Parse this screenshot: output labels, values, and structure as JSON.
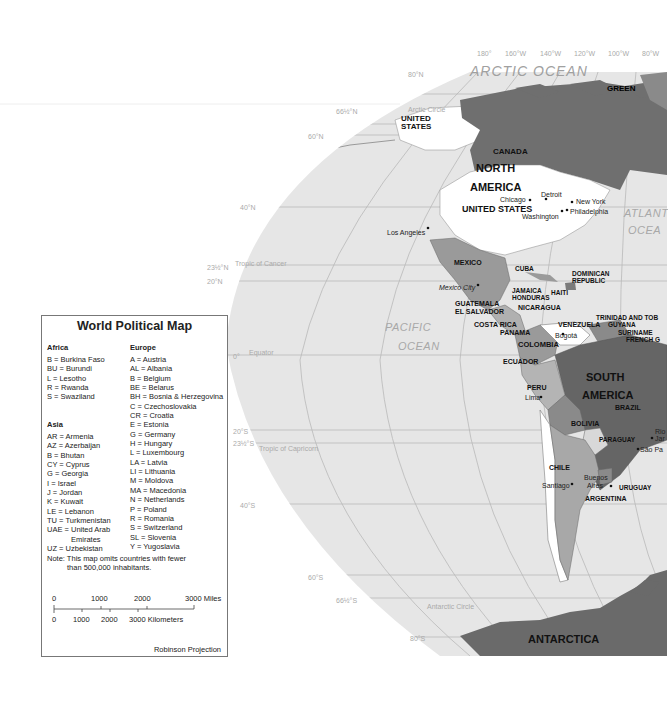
{
  "map": {
    "title": "World Political Map",
    "projection": "Robinson Projection",
    "colors": {
      "ocean": "#e6e6e6",
      "land_dark": "#6b6b6b",
      "land_medium": "#909090",
      "land_light": "#b4b4b4",
      "land_white": "#ffffff",
      "gridline": "#b8b8b8",
      "legend_border": "#777777"
    },
    "longitude_labels": [
      "180°",
      "160°W",
      "140°W",
      "120°W",
      "100°W",
      "80°W"
    ],
    "latitude_labels": {
      "n80": "80°N",
      "n66": "66½°N",
      "n60": "60°N",
      "n40": "40°N",
      "n23": "23½°N",
      "n20": "20°N",
      "eq": "0°",
      "s20": "20°S",
      "s23": "23½°S",
      "s40": "40°S",
      "s60": "60°S",
      "s66": "66½°S",
      "s80": "80°S"
    },
    "special_lines": {
      "arctic_circle": "Arctic Circle",
      "tropic_cancer": "Tropic of Cancer",
      "equator": "Equator",
      "tropic_capricorn": "Tropic of Capricorn",
      "antarctic_circle": "Antarctic Circle"
    },
    "oceans": {
      "arctic": "ARCTIC OCEAN",
      "pacific_1": "PACIFIC",
      "pacific_2": "OCEAN",
      "atlantic_1": "ATLANT",
      "atlantic_2": "OCEA"
    },
    "continents": {
      "north_1": "NORTH",
      "north_2": "AMERICA",
      "south_1": "SOUTH",
      "south_2": "AMERICA",
      "antarctica": "ANTARCTICA"
    },
    "countries": {
      "us_alaska_1": "UNITED",
      "us_alaska_2": "STATES",
      "canada": "CANADA",
      "united_states": "UNITED STATES",
      "greenland": "GREEN",
      "mexico": "MEXICO",
      "cuba": "CUBA",
      "dominican_1": "DOMINICAN",
      "dominican_2": "REPUBLIC",
      "jamaica": "JAMAICA",
      "haiti": "HAITI",
      "honduras": "HONDURAS",
      "guatemala": "GUATEMALA",
      "el_salvador": "EL SALVADOR",
      "nicaragua": "NICARAGUA",
      "costa_rica": "COSTA RICA",
      "panama": "PANAMA",
      "trinidad": "TRINIDAD AND TOB",
      "venezuela": "VENEZUELA",
      "guyana": "GUYANA",
      "suriname": "SURINAME",
      "french_guiana": "FRENCH G",
      "colombia": "COLOMBIA",
      "ecuador": "ECUADOR",
      "peru": "PERU",
      "brazil": "BRAZIL",
      "bolivia": "BOLIVIA",
      "paraguay": "PARAGUAY",
      "chile": "CHILE",
      "uruguay": "URUGUAY",
      "argentina": "ARGENTINA"
    },
    "cities": {
      "chicago": "Chicago",
      "detroit": "Detroit",
      "new_york": "New York",
      "philadelphia": "Philadelphia",
      "washington": "Washington",
      "los_angeles": "Los Angeles",
      "mexico_city": "Mexico City",
      "bogota": "Bogotá",
      "lima": "Lima",
      "rio_1": "Rio",
      "rio_2": "Jar",
      "sao_paulo": "São Pa",
      "santiago": "Santiago",
      "buenos_1": "Buenos",
      "buenos_2": "Aires"
    }
  },
  "legend": {
    "title": "World Political Map",
    "africa": {
      "heading": "Africa",
      "items": [
        "B = Burkina Faso",
        "BU = Burundi",
        "L = Lesotho",
        "R = Rwanda",
        "S = Swaziland"
      ]
    },
    "asia": {
      "heading": "Asia",
      "items": [
        "AR = Armenia",
        "AZ = Azerbaijan",
        "B = Bhutan",
        "CY = Cyprus",
        "G = Georgia",
        "I = Israel",
        "J = Jordan",
        "K = Kuwait",
        "LE = Lebanon",
        "TU = Turkmenistan",
        "UAE = United Arab",
        "Emirates",
        "UZ = Uzbekistan"
      ]
    },
    "europe": {
      "heading": "Europe",
      "items": [
        "A = Austria",
        "AL = Albania",
        "B = Belgium",
        "BE = Belarus",
        "BH = Bosnia & Herzegovina",
        "C = Czechoslovakia",
        "CR = Croatia",
        "E = Estonia",
        "G = Germany",
        "H = Hungary",
        "L = Luxembourg",
        "LA = Latvia",
        "LI = Lithuania",
        "M = Moldova",
        "MA = Macedonia",
        "N = Netherlands",
        "P = Poland",
        "R = Romania",
        "S = Switzerland",
        "SL = Slovenia",
        "Y = Yugoslavia"
      ]
    },
    "note_1": "Note: This map omits countries with fewer",
    "note_2": "than 500,000 inhabitants.",
    "scale": {
      "miles": [
        "0",
        "1000",
        "2000",
        "3000 Miles"
      ],
      "kilometers": [
        "0",
        "1000",
        "2000",
        "3000 Kilometers"
      ]
    },
    "projection": "Robinson Projection"
  }
}
